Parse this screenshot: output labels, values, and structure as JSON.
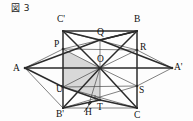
{
  "figure": {
    "caption": "図 3",
    "caption_icon": "framed-figure-icon",
    "number": "3"
  },
  "colors": {
    "stroke": "#2b2b2b",
    "thin_stroke": "#4a4a4a",
    "shade_fill": "#d6d6d6",
    "background": "#fdfdfd",
    "label": "#101010"
  },
  "diagram": {
    "type": "geometry-3d-projection",
    "points": [
      {
        "id": "Cp",
        "label": "C'",
        "x": 63,
        "y": 31,
        "lx": 57,
        "ly": 22
      },
      {
        "id": "B",
        "label": "B",
        "x": 137,
        "y": 31,
        "lx": 134,
        "ly": 22
      },
      {
        "id": "P",
        "label": "P",
        "x": 63,
        "y": 49,
        "lx": 54,
        "ly": 47
      },
      {
        "id": "Q",
        "label": "Q",
        "x": 100,
        "y": 40,
        "lx": 97,
        "ly": 35
      },
      {
        "id": "R",
        "label": "R",
        "x": 137,
        "y": 50,
        "lx": 140,
        "ly": 50
      },
      {
        "id": "A",
        "label": "A",
        "x": 25,
        "y": 68,
        "lx": 13,
        "ly": 71
      },
      {
        "id": "Ap",
        "label": "A'",
        "x": 172,
        "y": 68,
        "lx": 174,
        "ly": 70
      },
      {
        "id": "O",
        "label": "O",
        "x": 100,
        "y": 68,
        "lx": 97,
        "ly": 62
      },
      {
        "id": "U",
        "label": "U",
        "x": 63,
        "y": 87,
        "lx": 56,
        "ly": 92
      },
      {
        "id": "S",
        "label": "S",
        "x": 137,
        "y": 86,
        "lx": 139,
        "ly": 93
      },
      {
        "id": "T",
        "label": "T",
        "x": 100,
        "y": 100,
        "lx": 97,
        "ly": 110
      },
      {
        "id": "H",
        "label": "H",
        "x": 89,
        "y": 104,
        "lx": 85,
        "ly": 115
      },
      {
        "id": "Bp",
        "label": "B'",
        "x": 63,
        "y": 108,
        "lx": 56,
        "ly": 117
      },
      {
        "id": "C",
        "label": "C",
        "x": 137,
        "y": 108,
        "lx": 134,
        "ly": 118
      }
    ],
    "thick_segments": [
      [
        "Cp",
        "B"
      ],
      [
        "Cp",
        "Bp"
      ],
      [
        "B",
        "C"
      ],
      [
        "A",
        "Q"
      ],
      [
        "Q",
        "Ap"
      ],
      [
        "A",
        "U"
      ],
      [
        "U",
        "T"
      ],
      [
        "T",
        "C"
      ],
      [
        "Bp",
        "O"
      ],
      [
        "O",
        "C"
      ],
      [
        "Cp",
        "O"
      ],
      [
        "O",
        "B"
      ],
      [
        "Bp",
        "T"
      ],
      [
        "A",
        "O"
      ],
      [
        "O",
        "Ap"
      ],
      [
        "Cp",
        "Q"
      ],
      [
        "Q",
        "B"
      ],
      [
        "B",
        "Q"
      ]
    ],
    "thin_segments": [
      [
        "Cp",
        "R"
      ],
      [
        "B",
        "P"
      ],
      [
        "P",
        "R"
      ],
      [
        "P",
        "O"
      ],
      [
        "O",
        "R"
      ],
      [
        "U",
        "S"
      ],
      [
        "Bp",
        "S"
      ],
      [
        "C",
        "U"
      ],
      [
        "O",
        "T"
      ],
      [
        "O",
        "H"
      ],
      [
        "O",
        "S"
      ],
      [
        "O",
        "U"
      ],
      [
        "A",
        "P"
      ],
      [
        "R",
        "Ap"
      ],
      [
        "S",
        "Ap"
      ],
      [
        "A",
        "Bp"
      ],
      [
        "Q",
        "O"
      ],
      [
        "Bp",
        "C"
      ]
    ],
    "shaded_region": [
      "P",
      "O",
      "T",
      "U"
    ],
    "right_angle_marker": {
      "at": "T",
      "size": 5
    },
    "arrow_marker": {
      "from_x": 84,
      "from_y": 112,
      "to_x": 92,
      "to_y": 101
    }
  }
}
